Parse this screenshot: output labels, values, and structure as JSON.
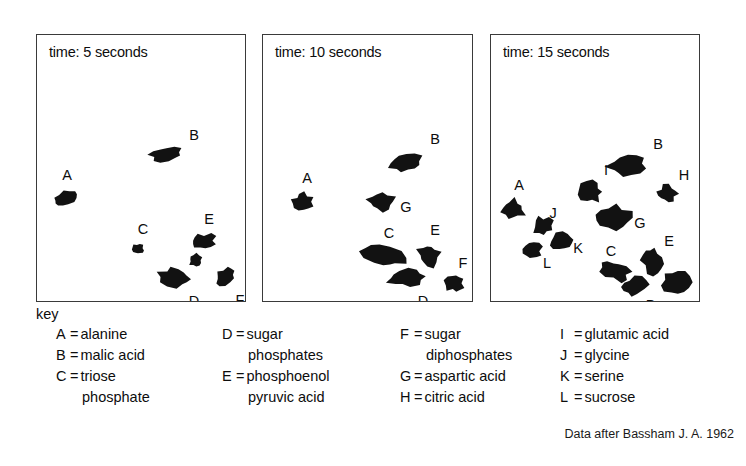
{
  "figure": {
    "attribution": "Data after Bassham J. A. 1962",
    "key_heading": "key"
  },
  "panels": [
    {
      "id": "panel-5s",
      "title": "time: 5 seconds",
      "box": {
        "x": 36,
        "y": 34,
        "w": 210,
        "h": 268
      },
      "spots": [
        {
          "code": "A",
          "cx": 28,
          "cy": 165,
          "rx": 13,
          "ry": 7,
          "rot": -20,
          "label_x": 30,
          "label_y": 140
        },
        {
          "code": "B",
          "cx": 130,
          "cy": 120,
          "rx": 18,
          "ry": 8,
          "rot": -8,
          "label_x": 157,
          "label_y": 100
        },
        {
          "code": "C",
          "cx": 102,
          "cy": 216,
          "rx": 7,
          "ry": 6,
          "rot": 10,
          "label_x": 106,
          "label_y": 194
        },
        {
          "code": "D",
          "cx": 140,
          "cy": 244,
          "rx": 18,
          "ry": 10,
          "rot": 8,
          "label_x": 157,
          "label_y": 266
        },
        {
          "code": "E",
          "cx": 168,
          "cy": 208,
          "rx": 13,
          "ry": 8,
          "rot": -5,
          "label_x": 172,
          "label_y": 184
        },
        {
          "code": "F",
          "cx": 190,
          "cy": 243,
          "rx": 12,
          "ry": 8,
          "rot": -30,
          "label_x": 203,
          "label_y": 265
        },
        {
          "code": "",
          "cx": 160,
          "cy": 227,
          "rx": 8,
          "ry": 7,
          "rot": 0,
          "label_x": 0,
          "label_y": 0
        }
      ]
    },
    {
      "id": "panel-10s",
      "title": "time: 10 seconds",
      "box": {
        "x": 262,
        "y": 34,
        "w": 211,
        "h": 268
      },
      "spots": [
        {
          "code": "A",
          "cx": 40,
          "cy": 168,
          "rx": 11,
          "ry": 9,
          "rot": 0,
          "label_x": 44,
          "label_y": 143
        },
        {
          "code": "B",
          "cx": 144,
          "cy": 129,
          "rx": 20,
          "ry": 11,
          "rot": -8,
          "label_x": 172,
          "label_y": 104
        },
        {
          "code": "G",
          "cx": 119,
          "cy": 168,
          "rx": 15,
          "ry": 10,
          "rot": 0,
          "label_x": 143,
          "label_y": 172
        },
        {
          "code": "C",
          "cx": 122,
          "cy": 223,
          "rx": 23,
          "ry": 11,
          "rot": 18,
          "label_x": 126,
          "label_y": 198
        },
        {
          "code": "D",
          "cx": 145,
          "cy": 245,
          "rx": 20,
          "ry": 9,
          "rot": -6,
          "label_x": 160,
          "label_y": 266
        },
        {
          "code": "E",
          "cx": 167,
          "cy": 222,
          "rx": 12,
          "ry": 12,
          "rot": -15,
          "label_x": 172,
          "label_y": 195
        },
        {
          "code": "F",
          "cx": 194,
          "cy": 250,
          "rx": 10,
          "ry": 10,
          "rot": 0,
          "label_x": 200,
          "label_y": 228
        }
      ]
    },
    {
      "id": "panel-15s",
      "title": "time: 15 seconds",
      "box": {
        "x": 490,
        "y": 34,
        "w": 210,
        "h": 268
      },
      "spots": [
        {
          "code": "A",
          "cx": 22,
          "cy": 176,
          "rx": 13,
          "ry": 11,
          "rot": 0,
          "label_x": 28,
          "label_y": 150
        },
        {
          "code": "B",
          "cx": 138,
          "cy": 132,
          "rx": 22,
          "ry": 13,
          "rot": -10,
          "label_x": 167,
          "label_y": 109
        },
        {
          "code": "I",
          "cx": 101,
          "cy": 158,
          "rx": 12,
          "ry": 11,
          "rot": 0,
          "label_x": 115,
          "label_y": 135
        },
        {
          "code": "H",
          "cx": 178,
          "cy": 160,
          "rx": 11,
          "ry": 9,
          "rot": 0,
          "label_x": 193,
          "label_y": 140
        },
        {
          "code": "G",
          "cx": 124,
          "cy": 184,
          "rx": 18,
          "ry": 12,
          "rot": 0,
          "label_x": 149,
          "label_y": 188
        },
        {
          "code": "J",
          "cx": 52,
          "cy": 192,
          "rx": 11,
          "ry": 10,
          "rot": 0,
          "label_x": 62,
          "label_y": 178
        },
        {
          "code": "K",
          "cx": 72,
          "cy": 208,
          "rx": 13,
          "ry": 9,
          "rot": -8,
          "label_x": 87,
          "label_y": 213
        },
        {
          "code": "L",
          "cx": 42,
          "cy": 218,
          "rx": 10,
          "ry": 9,
          "rot": 0,
          "label_x": 56,
          "label_y": 228
        },
        {
          "code": "C",
          "cx": 125,
          "cy": 237,
          "rx": 17,
          "ry": 10,
          "rot": 22,
          "label_x": 120,
          "label_y": 216
        },
        {
          "code": "D",
          "cx": 145,
          "cy": 254,
          "rx": 14,
          "ry": 10,
          "rot": -10,
          "label_x": 160,
          "label_y": 270
        },
        {
          "code": "E",
          "cx": 163,
          "cy": 227,
          "rx": 11,
          "ry": 15,
          "rot": -18,
          "label_x": 178,
          "label_y": 206
        },
        {
          "code": "F",
          "cx": 187,
          "cy": 249,
          "rx": 14,
          "ry": 12,
          "rot": 0,
          "label_x": 198,
          "label_y": 273
        }
      ]
    }
  ],
  "key_columns": [
    {
      "id": "key-col-1",
      "rows": [
        {
          "code": "A",
          "eq": "=",
          "text": "alanine",
          "cont": false
        },
        {
          "code": "B",
          "eq": "=",
          "text": "malic acid",
          "cont": false
        },
        {
          "code": "C",
          "eq": "=",
          "text": "triose",
          "cont": false
        },
        {
          "code": "",
          "eq": "",
          "text": "phosphate",
          "cont": true
        }
      ]
    },
    {
      "id": "key-col-2",
      "rows": [
        {
          "code": "D",
          "eq": "=",
          "text": "sugar",
          "cont": false
        },
        {
          "code": "",
          "eq": "",
          "text": "phosphates",
          "cont": true
        },
        {
          "code": "E",
          "eq": "=",
          "text": "phosphoenol",
          "cont": false
        },
        {
          "code": "",
          "eq": "",
          "text": "pyruvic acid",
          "cont": true
        }
      ]
    },
    {
      "id": "key-col-3",
      "rows": [
        {
          "code": "F",
          "eq": "=",
          "text": "sugar",
          "cont": false
        },
        {
          "code": "",
          "eq": "",
          "text": "diphosphates",
          "cont": true
        },
        {
          "code": "G",
          "eq": "=",
          "text": "aspartic acid",
          "cont": false
        },
        {
          "code": "H",
          "eq": "=",
          "text": "citric acid",
          "cont": false
        }
      ]
    },
    {
      "id": "key-col-4",
      "rows": [
        {
          "code": "I",
          "eq": "=",
          "text": "glutamic acid",
          "cont": false
        },
        {
          "code": "J",
          "eq": "=",
          "text": "glycine",
          "cont": false
        },
        {
          "code": "K",
          "eq": "=",
          "text": "serine",
          "cont": false
        },
        {
          "code": "L",
          "eq": "=",
          "text": "sucrose",
          "cont": false
        }
      ]
    }
  ],
  "colors": {
    "spot_fill": "#121212",
    "panel_border": "#3a3a3a",
    "text": "#0d0d0d",
    "background": "#ffffff"
  }
}
